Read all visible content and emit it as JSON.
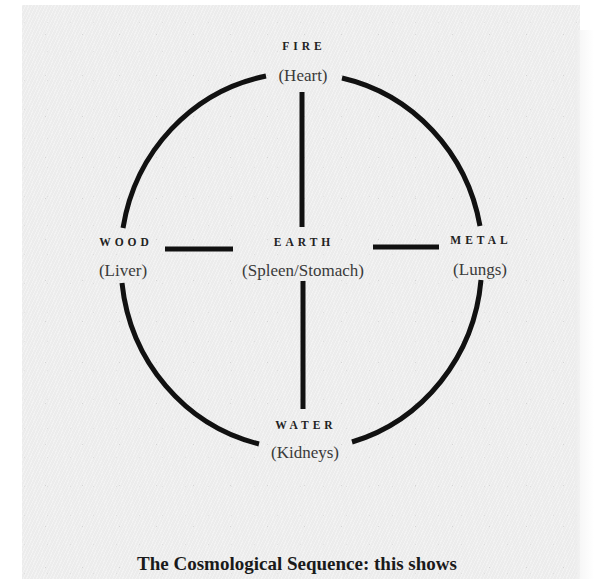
{
  "diagram": {
    "nodes": {
      "fire": {
        "element": "FIRE",
        "organ": "(Heart)"
      },
      "wood": {
        "element": "WOOD",
        "organ": "(Liver)"
      },
      "earth": {
        "element": "EARTH",
        "organ": "(Spleen/Stomach)"
      },
      "metal": {
        "element": "METAL",
        "organ": "(Lungs)"
      },
      "water": {
        "element": "WATER",
        "organ": "(Kidneys)"
      }
    },
    "stroke_color": "#111111",
    "background_color": "#ececec"
  },
  "caption": "The Cosmological Sequence: this shows"
}
